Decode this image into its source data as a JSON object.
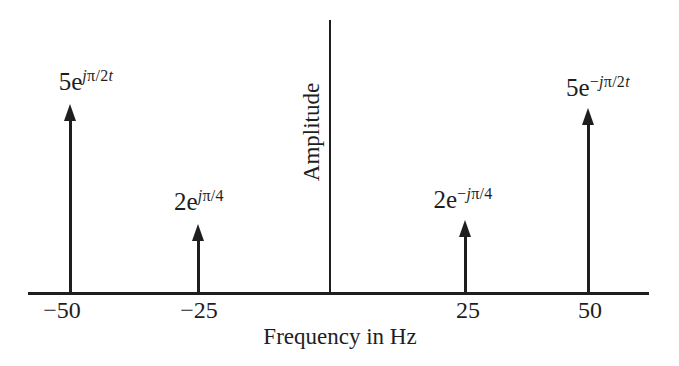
{
  "figure": {
    "background_color": "#ffffff",
    "ink_color": "#1e1e1e"
  },
  "chart_data": {
    "type": "stem",
    "title": "",
    "xlabel": "Frequency in Hz",
    "ylabel": "Amplitude",
    "x_ticks": [
      "−50",
      "−25",
      "25",
      "50"
    ],
    "grid": false,
    "legend": false,
    "points": [
      {
        "frequency_hz": -50,
        "amplitude": 5,
        "label": "5e^(jπ/2t)",
        "tick_label": "−50",
        "label_parts": {
          "base": "5e",
          "sup_j": "j",
          "sup_mid": "π/2",
          "sup_t": "t"
        }
      },
      {
        "frequency_hz": -25,
        "amplitude": 2,
        "label": "2e^(jπ/4)",
        "tick_label": "−25",
        "label_parts": {
          "base": "2e",
          "sup_j": "j",
          "sup_mid": "π/4"
        }
      },
      {
        "frequency_hz": 25,
        "amplitude": 2,
        "label": "2e^(−jπ/4)",
        "tick_label": "25",
        "label_parts": {
          "base": "2e",
          "sup_minus": "−",
          "sup_j": "j",
          "sup_mid": "π/4"
        }
      },
      {
        "frequency_hz": 50,
        "amplitude": 5,
        "label": "5e^(−jπ/2t)",
        "tick_label": "50",
        "label_parts": {
          "base": "5e",
          "sup_minus": "−",
          "sup_j": "j",
          "sup_mid": "π/2",
          "sup_t": "t"
        }
      }
    ]
  }
}
